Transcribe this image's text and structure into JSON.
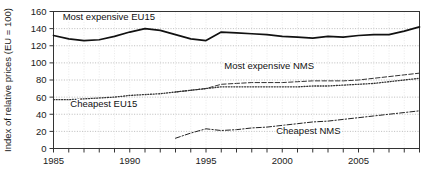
{
  "chart_data": {
    "type": "line",
    "title": "",
    "xlabel": "",
    "ylabel": "Index of relative prices (EU = 100)",
    "xlim": [
      1985,
      2009
    ],
    "ylim": [
      0,
      160
    ],
    "yticks": [
      0,
      20,
      40,
      60,
      80,
      100,
      120,
      140,
      160
    ],
    "xticks": [
      1985,
      1986,
      1987,
      1988,
      1989,
      1990,
      1991,
      1992,
      1993,
      1994,
      1995,
      1996,
      1997,
      1998,
      1999,
      2000,
      2001,
      2002,
      2003,
      2004,
      2005,
      2006,
      2007,
      2008,
      2009
    ],
    "xtick_labels": [
      "1985",
      "",
      "",
      "",
      "",
      "1990",
      "",
      "",
      "",
      "",
      "1995",
      "",
      "",
      "",
      "",
      "2000",
      "",
      "",
      "",
      "",
      "2005",
      "",
      "",
      "",
      ""
    ],
    "ytick_labels": [
      "0",
      "20",
      "40",
      "60",
      "80",
      "100",
      "120",
      "140",
      "160"
    ],
    "grid": true,
    "grid_style": "dotted-horizontal",
    "legend_position": "inline-annotations",
    "series": [
      {
        "name": "Most expensive EU15",
        "style": "solid",
        "color": "#111111",
        "label_x": 1985.6,
        "label_y": 150,
        "x": [
          1985,
          1986,
          1987,
          1988,
          1989,
          1990,
          1991,
          1992,
          1993,
          1994,
          1995,
          1996,
          1997,
          1998,
          1999,
          2000,
          2001,
          2002,
          2003,
          2004,
          2005,
          2006,
          2007,
          2008,
          2009
        ],
        "values": [
          132,
          128,
          126,
          127,
          131,
          136,
          140,
          138,
          133,
          128,
          126,
          136,
          135,
          134,
          133,
          131,
          130,
          129,
          131,
          130,
          132,
          133,
          133,
          137,
          142
        ]
      },
      {
        "name": "Most expensive NMS",
        "style": "dashed",
        "color": "#333333",
        "label_x": 1996.2,
        "label_y": 93,
        "x": [
          1993,
          1994,
          1995,
          1996,
          1997,
          1998,
          1999,
          2000,
          2001,
          2002,
          2003,
          2004,
          2005,
          2006,
          2007,
          2008,
          2009
        ],
        "values": [
          66,
          68,
          70,
          75,
          76,
          77,
          77,
          77,
          78,
          79,
          79,
          79,
          80,
          82,
          84,
          86,
          88
        ]
      },
      {
        "name": "Cheapest EU15",
        "style": "dotted",
        "color": "#333333",
        "label_x": 1986.1,
        "label_y": 49,
        "x": [
          1985,
          1986,
          1987,
          1988,
          1989,
          1990,
          1991,
          1992,
          1993,
          1994,
          1995,
          1996,
          1997,
          1998,
          1999,
          2000,
          2001,
          2002,
          2003,
          2004,
          2005,
          2006,
          2007,
          2008,
          2009
        ],
        "values": [
          57,
          57,
          58,
          59,
          60,
          62,
          63,
          64,
          66,
          68,
          70,
          72,
          72,
          72,
          72,
          72,
          72,
          73,
          73,
          74,
          75,
          76,
          78,
          80,
          82
        ]
      },
      {
        "name": "Cheapest NMS",
        "style": "dashdot",
        "color": "#222222",
        "label_x": 1999.6,
        "label_y": 17,
        "x": [
          1993,
          1994,
          1995,
          1996,
          1997,
          1998,
          1999,
          2000,
          2001,
          2002,
          2003,
          2004,
          2005,
          2006,
          2007,
          2008,
          2009
        ],
        "values": [
          12,
          18,
          23,
          21,
          22,
          24,
          25,
          27,
          29,
          31,
          32,
          34,
          36,
          38,
          40,
          42,
          44
        ]
      }
    ]
  }
}
